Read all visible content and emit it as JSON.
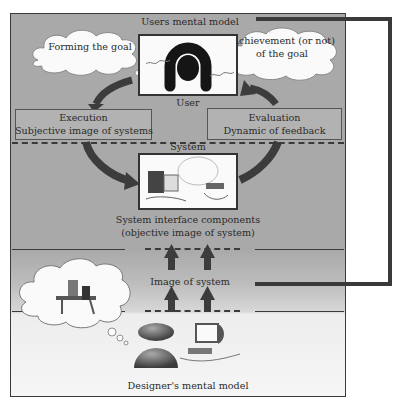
{
  "diagram": {
    "top_label": "Users mental model",
    "clouds": {
      "forming_goal": "Forming the goal",
      "achievement_line1": "Achievement (or not)",
      "achievement_line2": "of the goal"
    },
    "user_label": "User",
    "execution": {
      "title": "Execution",
      "subtitle": "Subjective image of systems"
    },
    "evaluation": {
      "title": "Evaluation",
      "subtitle": "Dynamic of feedback"
    },
    "system_label": "System",
    "system_components_line1": "System interface components",
    "system_components_line2": "(objective image of system)",
    "image_of_system": "Image of system",
    "designer_label": "Designer's mental model"
  },
  "colors": {
    "background_gray": "#a9a9a9",
    "bottom_light": "#f6f6f6",
    "arrow": "#3c3c3c",
    "border": "#333333"
  }
}
